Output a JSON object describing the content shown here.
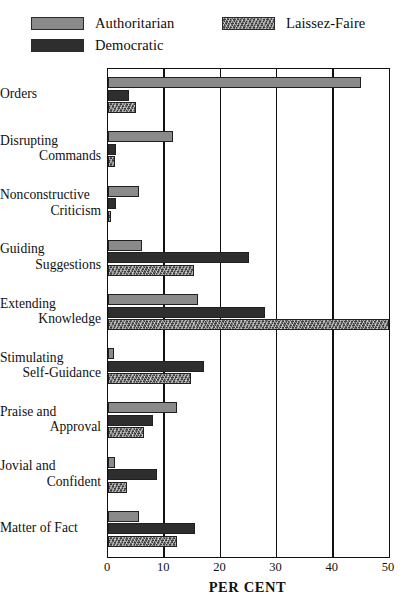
{
  "legend": {
    "entries": [
      {
        "label": "Authoritarian",
        "key": "authoritarian",
        "color": "#8a8a8a",
        "pattern": "solid-gray"
      },
      {
        "label": "Laissez-Faire",
        "key": "laissez_faire",
        "color": "#3a3a3a",
        "pattern": "mottled-hatch"
      },
      {
        "label": "Democratic",
        "key": "democratic",
        "color": "#2e2e2e",
        "pattern": "solid-dark"
      }
    ]
  },
  "axis": {
    "ticks": [
      "0",
      "10",
      "20",
      "30",
      "40",
      "50"
    ],
    "title": "PER CENT"
  },
  "chart_data": {
    "type": "bar",
    "orientation": "horizontal",
    "title": "",
    "xlabel": "PER CENT",
    "ylabel": "",
    "xlim": [
      0,
      50
    ],
    "xticks": [
      0,
      10,
      20,
      30,
      40,
      50
    ],
    "grid": "vertical",
    "legend_position": "top",
    "categories": [
      "Orders",
      "Disrupting Commands",
      "Nonconstructive Criticism",
      "Guiding Suggestions",
      "Extending Knowledge",
      "Stimulating Self-Guidance",
      "Praise and Approval",
      "Jovial and Confident",
      "Matter of Fact"
    ],
    "category_lines": [
      [
        "Orders",
        ""
      ],
      [
        "Disrupting",
        "Commands"
      ],
      [
        "Nonconstructive",
        "Criticism"
      ],
      [
        "Guiding",
        "Suggestions"
      ],
      [
        "Extending",
        "Knowledge"
      ],
      [
        "Stimulating",
        "Self-Guidance"
      ],
      [
        "Praise and",
        "Approval"
      ],
      [
        "Jovial and",
        "Confident"
      ],
      [
        "Matter of Fact",
        ""
      ]
    ],
    "series": [
      {
        "name": "Authoritarian",
        "values": [
          45.0,
          11.5,
          5.5,
          6.0,
          16.0,
          1.0,
          12.3,
          1.3,
          5.5
        ]
      },
      {
        "name": "Democratic",
        "values": [
          3.7,
          1.5,
          1.5,
          25.0,
          28.0,
          17.0,
          8.0,
          8.7,
          15.5
        ]
      },
      {
        "name": "Laissez-Faire",
        "values": [
          5.0,
          1.3,
          0.5,
          15.3,
          50.0,
          14.8,
          6.4,
          3.4,
          12.3
        ]
      }
    ]
  }
}
